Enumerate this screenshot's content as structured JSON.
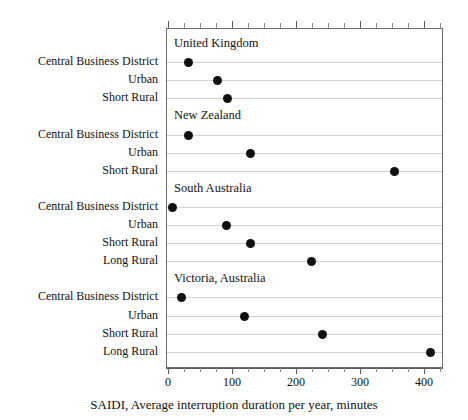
{
  "chart_data": {
    "type": "scatter",
    "title": "",
    "xlabel": "SAIDI, Average interruption duration per year, minutes",
    "ylabel": "",
    "xlim": [
      0,
      433
    ],
    "xticks": [
      0,
      100,
      200,
      300,
      400
    ],
    "xtick_labels": [
      "0",
      "100",
      "200",
      "300",
      "400"
    ],
    "minor_tick_step": 25,
    "grid": true,
    "legend": "none",
    "panels": [
      {
        "name": "United Kingdom",
        "categories": [
          "Central Business District",
          "Urban",
          "Short Rural"
        ],
        "values": [
          31,
          75,
          92
        ]
      },
      {
        "name": "New Zealand",
        "categories": [
          "Central Business District",
          "Urban",
          "Short Rural"
        ],
        "values": [
          30,
          127,
          352
        ]
      },
      {
        "name": "South Australia",
        "categories": [
          "Central Business District",
          "Urban",
          "Short Rural",
          "Long Rural"
        ],
        "values": [
          6,
          90,
          127,
          222
        ]
      },
      {
        "name": "Victoria, Australia",
        "categories": [
          "Central Business District",
          "Urban",
          "Short Rural",
          "Long Rural"
        ],
        "values": [
          20,
          118,
          240,
          408
        ]
      }
    ],
    "marker": {
      "shape": "circle",
      "color": "#111111",
      "size": 9
    },
    "colors": {
      "gridline": "#d0d0d0",
      "axis": "#5a5a5a",
      "frame": "#6d6d6d",
      "text": "#111111",
      "background": "#ffffff"
    }
  }
}
